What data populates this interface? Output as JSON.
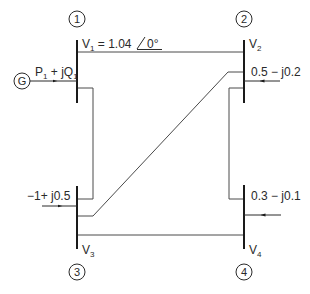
{
  "diagram": {
    "type": "four-bus power system one-line diagram",
    "buses": [
      {
        "id": "1",
        "number_label": "1",
        "voltage_label": "V",
        "voltage_sub": "1",
        "voltage_value": " = 1.04",
        "angle": "0°"
      },
      {
        "id": "2",
        "number_label": "2",
        "voltage_label": "V",
        "voltage_sub": "2"
      },
      {
        "id": "3",
        "number_label": "3",
        "voltage_label": "V",
        "voltage_sub": "3"
      },
      {
        "id": "4",
        "number_label": "4",
        "voltage_label": "V",
        "voltage_sub": "4"
      }
    ],
    "generator": {
      "symbol": "G",
      "power_P": "P",
      "power_P_sub": "1",
      "power_mid": " + jQ",
      "power_Q_sub": "1"
    },
    "injections": {
      "bus2": "0.5 − j0.2",
      "bus3": "−1+ j0.5",
      "bus4": "0.3 − j0.1"
    },
    "lines": [
      {
        "from": "1",
        "to": "2"
      },
      {
        "from": "1",
        "to": "3"
      },
      {
        "from": "2",
        "to": "3"
      },
      {
        "from": "2",
        "to": "4"
      },
      {
        "from": "3",
        "to": "4"
      }
    ],
    "colors": {
      "bus": "#1a1a1a",
      "line": "#4a4a4a",
      "text": "#2a2a2a"
    }
  }
}
